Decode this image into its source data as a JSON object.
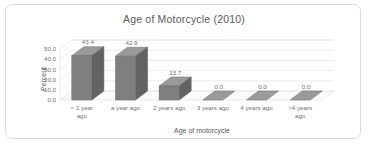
{
  "chart_data": {
    "type": "bar",
    "title": "Age of Motorcycle (2010)",
    "xlabel": "Age of motorcycle",
    "ylabel": "Percent",
    "categories": [
      "< 1 year ago",
      "a year ago",
      "2 years ago",
      "3 years ago",
      "4 years ago",
      ">4 years ago"
    ],
    "values": [
      43.4,
      42.9,
      13.7,
      0.0,
      0.0,
      0.0
    ],
    "data_labels": [
      "43.4",
      "42.9",
      "13.7",
      "0.0",
      "0.0",
      "0.0"
    ],
    "ylim": [
      0,
      50
    ],
    "ytick_labels": [
      "50.0",
      "40.0",
      "30.0",
      "20.0",
      "10.0",
      "0.0"
    ],
    "ytick_values": [
      50,
      40,
      30,
      20,
      10,
      0
    ],
    "grid": true,
    "legend": false,
    "style": "3d-column",
    "bar_color": "#7f7f7f",
    "bar_side_color": "#636363",
    "bar_top_color": "#9a9a9a",
    "grid_color": "#e2e2e2",
    "text_color": "#6f6f6f",
    "border_color": "#dcdcdc",
    "background": "#ffffff"
  }
}
